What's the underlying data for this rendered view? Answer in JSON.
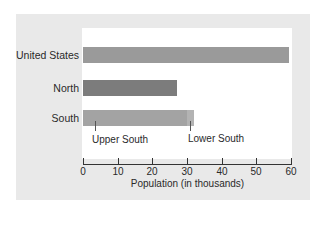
{
  "chart_data": {
    "type": "bar",
    "orientation": "horizontal",
    "title": "",
    "xlabel": "Population (in thousands)",
    "ylabel": "",
    "xlim": [
      0,
      60
    ],
    "x_ticks": [
      0,
      10,
      20,
      30,
      40,
      50,
      60
    ],
    "grid": false,
    "legend": null,
    "categories": [
      "United States",
      "North",
      "South"
    ],
    "values": [
      59.5,
      27,
      32
    ],
    "stacked_detail": {
      "South": [
        {
          "name": "Upper South",
          "value": 30
        },
        {
          "name": "Lower South",
          "value": 2
        }
      ]
    },
    "annotations": [
      "Upper South",
      "Lower South"
    ],
    "colors": {
      "United States": "#9a9a9a",
      "North": "#7c7c7c",
      "South_upper": "#a3a3a3",
      "South_lower": "#b3b3b3"
    }
  },
  "labels": {
    "cat0": "United States",
    "cat1": "North",
    "cat2": "South",
    "annot_upper": "Upper South",
    "annot_lower": "Lower South",
    "xlabel": "Population (in thousands)",
    "ticks": [
      "0",
      "10",
      "20",
      "30",
      "40",
      "50",
      "60"
    ]
  }
}
